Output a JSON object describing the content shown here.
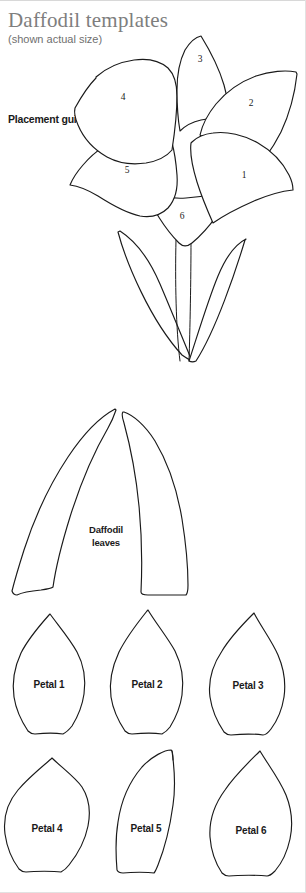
{
  "page": {
    "title": "Daffodil templates",
    "subtitle": "(shown actual size)",
    "placement_guide_label": "Placement guide",
    "background_color": "#ffffff",
    "outline_color": "#1a1a1a",
    "title_color": "#7e7e7e"
  },
  "placement_guide": {
    "petal_numbers": [
      {
        "id": "1",
        "label": "1",
        "x": 244,
        "y": 175
      },
      {
        "id": "2",
        "label": "2",
        "x": 251,
        "y": 103
      },
      {
        "id": "3",
        "label": "3",
        "x": 200,
        "y": 59
      },
      {
        "id": "4",
        "label": "4",
        "x": 123,
        "y": 97
      },
      {
        "id": "5",
        "label": "5",
        "x": 127,
        "y": 170
      },
      {
        "id": "6",
        "label": "6",
        "x": 182,
        "y": 216
      }
    ]
  },
  "leaves_section": {
    "label_line1": "Daffodil",
    "label_line2": "leaves",
    "count": 2
  },
  "petal_templates": [
    {
      "label": "Petal 1",
      "row": 1,
      "col": 1
    },
    {
      "label": "Petal 2",
      "row": 1,
      "col": 2
    },
    {
      "label": "Petal 3",
      "row": 1,
      "col": 3
    },
    {
      "label": "Petal 4",
      "row": 2,
      "col": 1
    },
    {
      "label": "Petal 5",
      "row": 2,
      "col": 2
    },
    {
      "label": "Petal 6",
      "row": 2,
      "col": 3
    }
  ]
}
